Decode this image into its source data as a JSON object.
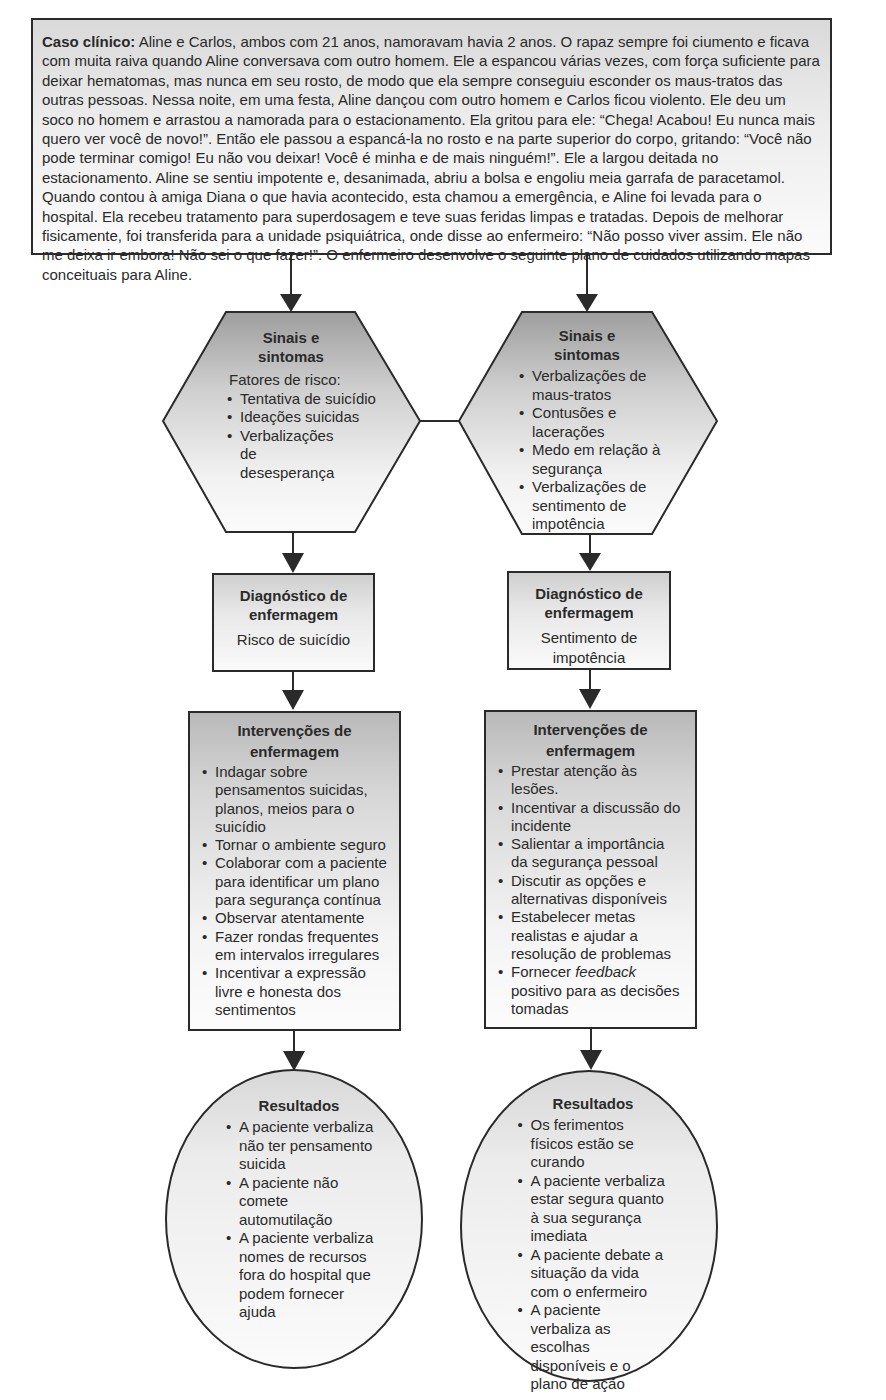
{
  "case": {
    "label": "Caso clínico:",
    "text": " Aline e Carlos, ambos com 21 anos, namoravam havia 2 anos. O rapaz sempre foi ciumento e ficava com muita raiva quando Aline conversava com outro homem. Ele a espancou várias vezes, com força suficiente para deixar hematomas, mas nunca em seu rosto, de modo que ela sempre conseguiu esconder os maus-tratos das outras pessoas. Nessa noite, em uma festa, Aline dançou com outro homem e Carlos ficou violento. Ele deu um soco no homem e arrastou a namorada para o estacionamento. Ela gritou para ele: “Chega! Acabou! Eu nunca mais quero ver você de novo!”. Então ele passou a espancá-la no rosto e na parte superior do corpo, gritando: “Você não pode terminar comigo! Eu não vou deixar! Você é minha e de mais ninguém!”. Ele a largou deitada no estacionamento. Aline se sentiu impotente e, desanimada, abriu a bolsa e engoliu meia garrafa de paracetamol. Quando contou à amiga Diana o que havia acontecido, esta chamou a emergência, e Aline foi levada para o hospital. Ela recebeu tratamento para superdosagem e teve suas feridas limpas e tratadas. Depois de melhorar fisicamente, foi transferida para a unidade psiquiátrica, onde disse ao enfermeiro: “Não posso viver assim. Ele não me deixa ir embora! Não sei o que fazer!”. O enfermeiro desenvolve o seguinte plano de cuidados utilizando mapas conceituais para Aline."
  },
  "left": {
    "signs": {
      "title_line1": "Sinais e",
      "title_line2": "sintomas",
      "intro": "Fatores de risco:",
      "items": [
        "Tentativa de suicídio",
        "Ideações suicidas",
        "Verbalizações de desesperança"
      ]
    },
    "diagnosis": {
      "title_line1": "Diagnóstico de",
      "title_line2": "enfermagem",
      "value": "Risco de suicídio"
    },
    "interventions": {
      "title_line1": "Intervenções de",
      "title_line2": "enfermagem",
      "items": [
        "Indagar sobre pensamentos suicidas, planos, meios para o suicídio",
        "Tornar o ambiente seguro",
        "Colaborar com a paciente para identificar um plano para segurança contínua",
        "Observar atentamente",
        "Fazer rondas frequentes em intervalos irregulares",
        "Incentivar a expressão livre e honesta dos sentimentos"
      ]
    },
    "results": {
      "title": "Resultados",
      "items": [
        "A paciente verbaliza não ter pensamento suicida",
        "A paciente não comete automutilação",
        "A paciente verbaliza nomes de recursos fora do hospital que podem fornecer ajuda"
      ]
    }
  },
  "right": {
    "signs": {
      "title_line1": "Sinais e",
      "title_line2": "sintomas",
      "items": [
        "Verbalizações de maus-tratos",
        "Contusões e lacerações",
        "Medo em relação à segurança",
        "Verbalizações de sentimento de impotência"
      ]
    },
    "diagnosis": {
      "title_line1": "Diagnóstico de",
      "title_line2": "enfermagem",
      "value": "Sentimento de impotência"
    },
    "interventions": {
      "title_line1": "Intervenções de",
      "title_line2": "enfermagem",
      "items": [
        "Prestar atenção às lesões.",
        "Incentivar a discussão do incidente",
        "Salientar a importância da segurança pessoal",
        "Discutir as opções e alternativas disponíveis",
        "Estabelecer metas realistas e ajudar a resolução de problemas"
      ],
      "last_item_prefix": "Fornecer ",
      "last_item_italic": "feedback",
      "last_item_suffix": " positivo para as decisões tomadas"
    },
    "results": {
      "title": "Resultados",
      "items": [
        "Os ferimentos físicos estão se curando",
        "A paciente verbaliza estar segura quanto à sua segurança imediata",
        "A paciente debate a situação da vida com o enfermeiro",
        "A paciente verbaliza as escolhas disponíveis e o plano de ação"
      ]
    }
  },
  "colors": {
    "stroke": "#2a2a2a",
    "fill_dark": "#a8a8a8",
    "fill_light": "#fafafa"
  }
}
